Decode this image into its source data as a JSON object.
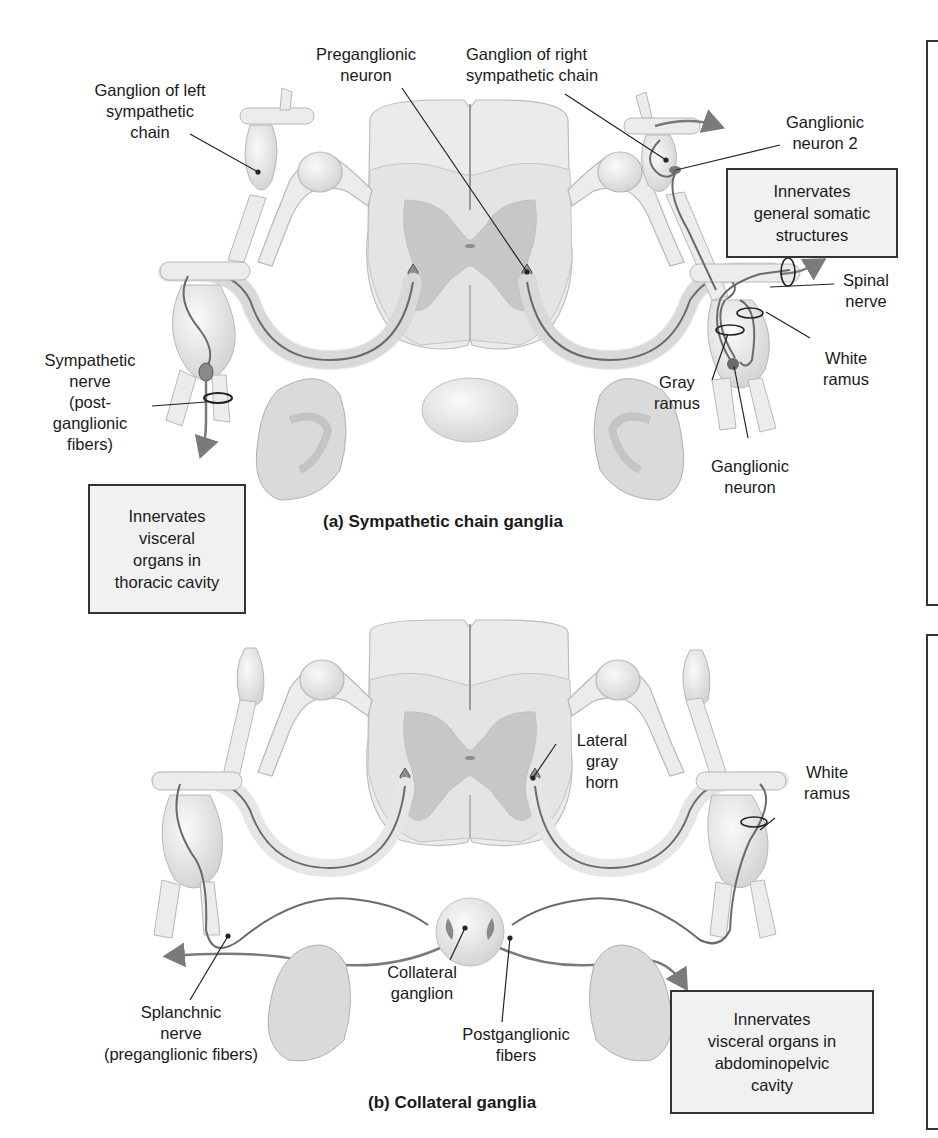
{
  "panel_a": {
    "caption": "(a) Sympathetic chain ganglia",
    "labels": {
      "preganglionic_neuron": "Preganglionic\nneuron",
      "ganglion_left_chain": "Ganglion of left\nsympathetic\nchain",
      "ganglion_right_chain": "Ganglion of right\nsympathetic chain",
      "ganglionic_neuron_2": "Ganglionic\nneuron 2",
      "spinal_nerve": "Spinal\nnerve",
      "white_ramus": "White\nramus",
      "gray_ramus": "Gray\nramus",
      "ganglionic_neuron": "Ganglionic\nneuron",
      "sympathetic_nerve": "Sympathetic\nnerve\n(post-\nganglionic\nfibers)"
    },
    "boxes": {
      "somatic": "Innervates\ngeneral somatic\nstructures",
      "thoracic": "Innervates\nvisceral\norgans in\nthoracic cavity"
    }
  },
  "panel_b": {
    "caption": "(b) Collateral ganglia",
    "labels": {
      "lateral_gray_horn": "Lateral\ngray\nhorn",
      "white_ramus": "White\nramus",
      "collateral_ganglion": "Collateral\nganglion",
      "splanchnic_nerve": "Splanchnic\nnerve\n(preganglionic fibers)",
      "postganglionic_fibers": "Postganglionic\nfibers"
    },
    "boxes": {
      "abdominopelvic": "Innervates\nvisceral organs in\nabdominopelvic\ncavity"
    }
  },
  "colors": {
    "tissue": "#ececec",
    "tissue_outline": "#b5b5b5",
    "gray_matter": "#c6c6c6",
    "nerve_fiber": "#6a6a6a",
    "box_fill": "#f1f1f1",
    "box_border": "#333333",
    "leader_line": "#222222"
  }
}
